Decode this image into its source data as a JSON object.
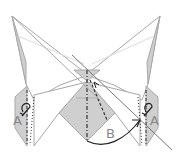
{
  "diagram": {
    "type": "origami-folding-step",
    "labels": {
      "left_flap": "A",
      "right_flap": "A",
      "center_fold": "B"
    },
    "colors": {
      "paper_front": "#ffffff",
      "paper_back": "#cfcfcf",
      "outline": "#a0a0a0",
      "fold_line": "#333333",
      "arrow": "#222222"
    }
  }
}
